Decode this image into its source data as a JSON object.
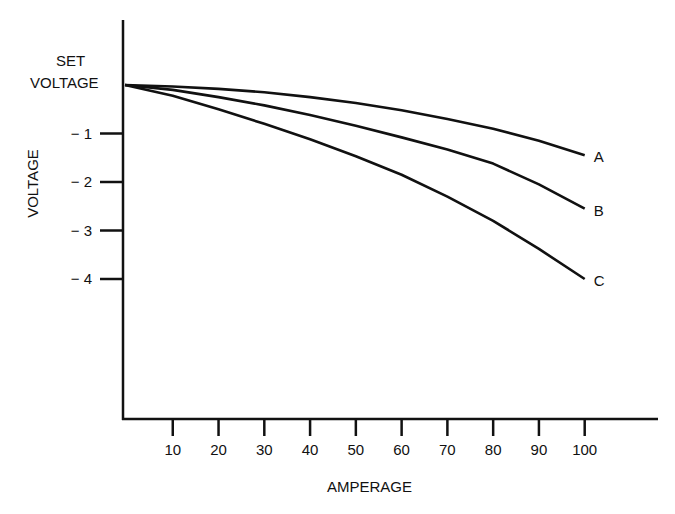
{
  "chart_data": {
    "type": "line",
    "title": "",
    "xlabel": "AMPERAGE",
    "ylabel": "VOLTAGE",
    "x_ticks": [
      "10",
      "20",
      "30",
      "40",
      "50",
      "60",
      "70",
      "80",
      "90",
      "100"
    ],
    "y_ticks": [
      "SET VOLTAGE",
      "-1",
      "-2",
      "-3",
      "-4"
    ],
    "y_top_label_line1": "SET",
    "y_top_label_line2": "VOLTAGE",
    "xlim": [
      0,
      125
    ],
    "ylim": [
      -7,
      0.7
    ],
    "grid": false,
    "x": [
      0,
      10,
      20,
      30,
      40,
      50,
      60,
      70,
      80,
      90,
      100
    ],
    "series": [
      {
        "name": "A",
        "values": [
          0,
          -0.03,
          -0.08,
          -0.15,
          -0.25,
          -0.37,
          -0.52,
          -0.7,
          -0.9,
          -1.15,
          -1.45
        ]
      },
      {
        "name": "B",
        "values": [
          0,
          -0.1,
          -0.25,
          -0.42,
          -0.62,
          -0.84,
          -1.08,
          -1.33,
          -1.62,
          -2.05,
          -2.55
        ]
      },
      {
        "name": "C",
        "values": [
          0,
          -0.22,
          -0.5,
          -0.8,
          -1.12,
          -1.47,
          -1.85,
          -2.3,
          -2.8,
          -3.38,
          -4.0
        ]
      }
    ],
    "legend": "inline labels at line ends"
  }
}
